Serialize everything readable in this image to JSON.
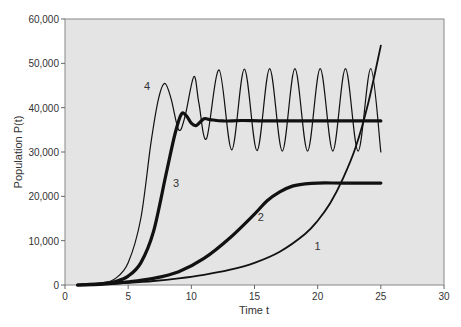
{
  "chart_data": {
    "type": "line",
    "title": "",
    "xlabel": "Time t",
    "ylabel": "Population P(t)",
    "xlim": [
      0,
      30
    ],
    "ylim": [
      0,
      60000
    ],
    "x_ticks": [
      "0",
      "5",
      "10",
      "15",
      "20",
      "25",
      "30"
    ],
    "y_ticks": [
      "0",
      "10,000",
      "20,000",
      "30,000",
      "40,000",
      "50,000",
      "60,000"
    ],
    "grid": false,
    "legend": "inline numeric labels",
    "series": [
      {
        "name": "1",
        "style": "medium",
        "points": [
          [
            1,
            0
          ],
          [
            3,
            200
          ],
          [
            5,
            500
          ],
          [
            7,
            900
          ],
          [
            9,
            1500
          ],
          [
            11,
            2300
          ],
          [
            13,
            3400
          ],
          [
            15,
            5000
          ],
          [
            17,
            7500
          ],
          [
            19,
            11500
          ],
          [
            20,
            14500
          ],
          [
            21,
            18500
          ],
          [
            22,
            24000
          ],
          [
            23,
            31000
          ],
          [
            24,
            41000
          ],
          [
            25,
            54000
          ]
        ]
      },
      {
        "name": "2",
        "style": "thick",
        "points": [
          [
            1,
            0
          ],
          [
            3,
            200
          ],
          [
            5,
            700
          ],
          [
            7,
            1500
          ],
          [
            9,
            3000
          ],
          [
            11,
            6000
          ],
          [
            13,
            10500
          ],
          [
            15,
            16000
          ],
          [
            16,
            19000
          ],
          [
            17,
            21000
          ],
          [
            18,
            22300
          ],
          [
            19,
            22800
          ],
          [
            20,
            23000
          ],
          [
            22,
            23000
          ],
          [
            25,
            23000
          ]
        ]
      },
      {
        "name": "3",
        "style": "thick",
        "points": [
          [
            1,
            0
          ],
          [
            3,
            300
          ],
          [
            4,
            800
          ],
          [
            5,
            2000
          ],
          [
            6,
            5000
          ],
          [
            7,
            12000
          ],
          [
            8,
            25000
          ],
          [
            8.7,
            34000
          ],
          [
            9.2,
            38500
          ],
          [
            9.6,
            38200
          ],
          [
            10,
            36500
          ],
          [
            10.4,
            36000
          ],
          [
            11,
            37500
          ],
          [
            11.5,
            37300
          ],
          [
            12.5,
            37000
          ],
          [
            14,
            37100
          ],
          [
            16,
            37000
          ],
          [
            20,
            37000
          ],
          [
            25,
            37000
          ]
        ]
      },
      {
        "name": "4",
        "style": "thin",
        "points": [
          [
            1,
            0
          ],
          [
            3,
            500
          ],
          [
            4,
            1500
          ],
          [
            5,
            5000
          ],
          [
            6,
            15000
          ],
          [
            6.8,
            32000
          ],
          [
            7.4,
            42000
          ],
          [
            7.9,
            45500
          ],
          [
            8.4,
            42000
          ],
          [
            9,
            35000
          ],
          [
            9.5,
            38000
          ],
          [
            10.2,
            47000
          ],
          [
            10.6,
            41000
          ],
          [
            11.2,
            33000
          ],
          [
            12.2,
            48500
          ],
          [
            13.2,
            30500
          ],
          [
            14.2,
            48700
          ],
          [
            15.2,
            30300
          ],
          [
            16.2,
            48800
          ],
          [
            17.2,
            30200
          ],
          [
            18.2,
            48800
          ],
          [
            19.2,
            30200
          ],
          [
            20.2,
            48800
          ],
          [
            21.2,
            30200
          ],
          [
            22.2,
            48800
          ],
          [
            23.2,
            30200
          ],
          [
            24.2,
            48800
          ],
          [
            25,
            30000
          ]
        ]
      }
    ],
    "annotations": [
      {
        "text": "1",
        "t": 20,
        "p": 8000
      },
      {
        "text": "2",
        "t": 15.5,
        "p": 14500
      },
      {
        "text": "3",
        "t": 8.8,
        "p": 22000
      },
      {
        "text": "4",
        "t": 6.5,
        "p": 44000
      }
    ]
  }
}
